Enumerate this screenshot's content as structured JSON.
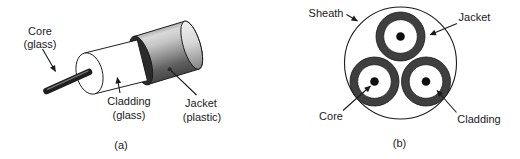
{
  "figure": {
    "panel_a": {
      "caption": "(a)",
      "labels": {
        "core": {
          "line1": "Core",
          "line2": "(glass)"
        },
        "cladding": {
          "line1": "Cladding",
          "line2": "(glass)"
        },
        "jacket": {
          "line1": "Jacket",
          "line2": "(plastic)"
        }
      }
    },
    "panel_b": {
      "caption": "(b)",
      "labels": {
        "sheath": "Sheath",
        "jacket": "Jacket",
        "core": "Core",
        "cladding": "Cladding"
      }
    },
    "colors": {
      "background": "#ffffff",
      "ink": "#1a1a1a",
      "jacket_gray_light": "#d9d9d9",
      "jacket_gray_dark": "#474747",
      "rim_dark": "#2b2b2b",
      "ring_dark": "#3f3f3f",
      "core_rod_dark": "#1f1f1f",
      "cladding_white": "#ffffff"
    }
  }
}
